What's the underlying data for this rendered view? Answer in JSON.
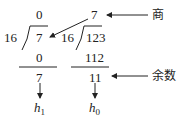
{
  "diagram": {
    "left_division": {
      "divisor": "16",
      "dividend": "7",
      "quotient": "0",
      "product": "0",
      "remainder": "7",
      "result_label": "h",
      "result_sub": "1"
    },
    "right_division": {
      "divisor": "16",
      "dividend": "123",
      "quotient": "7",
      "product": "112",
      "remainder": "11",
      "result_label": "h",
      "result_sub": "0"
    },
    "labels": {
      "quotient": "商",
      "remainder": "余数"
    }
  }
}
